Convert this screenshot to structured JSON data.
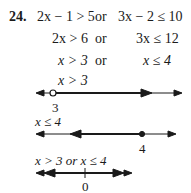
{
  "problem": {
    "number": "24.",
    "rows": [
      {
        "left": "2x − 1 > 5",
        "conj": "or",
        "right": "3x − 2 ≤ 10"
      },
      {
        "left": "2x > 6",
        "conj": "or",
        "right": "3x ≤ 12"
      },
      {
        "left": "x > 3",
        "conj": "or",
        "right": "x ≤ 4"
      },
      {
        "left": "x > 3",
        "conj": "",
        "right": ""
      }
    ]
  },
  "number_lines": [
    {
      "caption": "",
      "point_label": "3",
      "point": "open-circle",
      "direction": "right"
    },
    {
      "caption": "x ≤ 4",
      "point_label": "4",
      "point": "closed-dot",
      "direction": "left"
    },
    {
      "caption": "x > 3 or x ≤ 4",
      "point_label": "0",
      "point": "tick",
      "direction": "both"
    }
  ]
}
